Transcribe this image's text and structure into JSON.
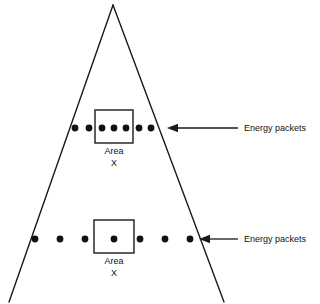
{
  "figure": {
    "type": "diagram",
    "background_color": "#ffffff",
    "line_color": "#1a1a1a",
    "dot_color": "#111111",
    "width": 320,
    "height": 304
  },
  "cone": {
    "name": "spreading-cone",
    "apex": {
      "x": 113,
      "y": 5
    },
    "left_base": {
      "x": 9,
      "y": 302
    },
    "right_base": {
      "x": 224,
      "y": 302
    }
  },
  "rows": [
    {
      "id": "near-row",
      "label": "Energy packets",
      "area_label_line1": "Area",
      "area_label_line2": "X",
      "dot_count": 7,
      "dots_in_area": 3,
      "dot_radius": 3.4,
      "row_y": 128,
      "dot_x": [
        75,
        89,
        102,
        114,
        126,
        139,
        151
      ],
      "box": {
        "x": 95,
        "y": 110,
        "width": 38,
        "height": 33
      },
      "area_text_x": 114,
      "area_text_y1": 154,
      "area_text_y2": 166,
      "arrow": {
        "tip_x": 167,
        "tail_x": 238,
        "y": 128
      },
      "label_x": 244,
      "label_y": 131
    },
    {
      "id": "far-row",
      "label": "Energy packets",
      "area_label_line1": "Area",
      "area_label_line2": "X",
      "dot_count": 7,
      "dots_in_area": 1,
      "dot_radius": 3.4,
      "row_y": 239,
      "dot_x": [
        35,
        60,
        85,
        114,
        140,
        165,
        190
      ],
      "box": {
        "x": 94,
        "y": 220,
        "width": 40,
        "height": 33
      },
      "area_text_x": 114,
      "area_text_y1": 264,
      "area_text_y2": 276,
      "arrow": {
        "tip_x": 199,
        "tail_x": 238,
        "y": 239
      },
      "label_x": 244,
      "label_y": 242
    }
  ]
}
